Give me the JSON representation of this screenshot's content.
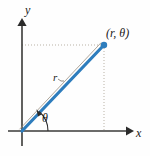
{
  "figure": {
    "kind": "polar-coordinate-diagram",
    "background_color": "#fefefe",
    "width": 150,
    "height": 156
  },
  "axes": {
    "x_label": "x",
    "y_label": "y",
    "axis_color": "#3a3a38",
    "origin": {
      "x": 22,
      "y": 131
    },
    "x_axis": {
      "x_start": 8,
      "x_end": 132,
      "y": 131
    },
    "y_axis": {
      "y_start": 20,
      "y_end": 146,
      "x": 22
    }
  },
  "point": {
    "label": "(r, θ)",
    "label_x": 106,
    "label_y": 36,
    "marker_x": 104,
    "marker_y": 45,
    "marker_color": "#2e7dbd",
    "marker_radius": 3.2
  },
  "radius": {
    "label": "r",
    "label_x": 55,
    "label_y": 80,
    "line_color": "#2e7dbd",
    "line_width": 3.2,
    "leader_color": "#7a6f63"
  },
  "angle": {
    "label": "θ",
    "label_x": 43,
    "label_y": 121,
    "arc_color": "#2b2b2b"
  },
  "guides": {
    "color": "#b9b2a6",
    "dash": "1,2",
    "horizontal": {
      "x_start": 22,
      "x_end": 104,
      "y": 45
    },
    "vertical": {
      "x": 104,
      "y_start": 45,
      "y_end": 131
    }
  }
}
